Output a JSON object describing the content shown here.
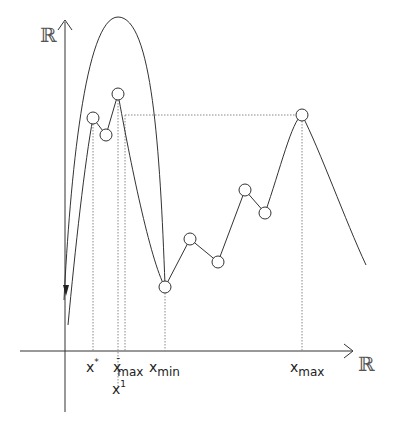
{
  "diagram": {
    "type": "function-optimization-sketch",
    "colors": {
      "stroke": "#333333",
      "dotted": "#888888",
      "background": "#ffffff"
    },
    "axes": {
      "y_label": "ℝ",
      "x_label": "ℝ"
    },
    "x_markers": [
      {
        "id": "x_star",
        "base": "x",
        "sup": "*",
        "sub": ""
      },
      {
        "id": "x_bar_max",
        "base": "x",
        "sup": "-",
        "sub": "max"
      },
      {
        "id": "x_one",
        "base": "x",
        "sup": "1",
        "sub": ""
      },
      {
        "id": "x_min",
        "base": "x",
        "sup": "",
        "sub": "min"
      },
      {
        "id": "x_max",
        "base": "x",
        "sup": "",
        "sub": "max"
      }
    ],
    "sample_points": [
      {
        "x": 93,
        "y": 118
      },
      {
        "x": 106,
        "y": 135
      },
      {
        "x": 118,
        "y": 94
      },
      {
        "x": 165,
        "y": 287
      },
      {
        "x": 190,
        "y": 239
      },
      {
        "x": 218,
        "y": 262
      },
      {
        "x": 245,
        "y": 190
      },
      {
        "x": 265,
        "y": 213
      },
      {
        "x": 302,
        "y": 115
      }
    ]
  }
}
